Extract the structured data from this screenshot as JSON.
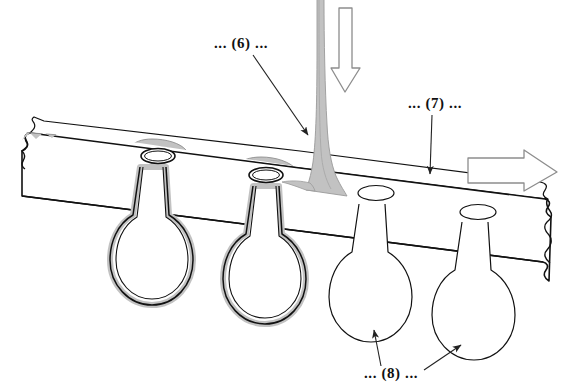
{
  "figure": {
    "type": "technical-line-diagram",
    "background_color": "#ffffff",
    "line_color": "#111111",
    "coating_fill_color": "#c2c2c2",
    "coating_edge_color": "#8a8a8a",
    "arrow_stroke_color": "#8d8d8d"
  },
  "callouts": [
    {
      "id": "callout-6",
      "label": "... (6) ...",
      "text_x": 214,
      "text_y": 48,
      "leader": {
        "x1": 253,
        "y1": 55,
        "x2": 308,
        "y2": 135
      },
      "refers_to": "vertical-coating-stream"
    },
    {
      "id": "callout-7",
      "label": "... (7) ...",
      "text_x": 408,
      "text_y": 108,
      "leader": {
        "x1": 432,
        "y1": 115,
        "x2": 430,
        "y2": 176
      },
      "refers_to": "perforated-plate"
    },
    {
      "id": "callout-8",
      "label": "... (8) ...",
      "text_x": 364,
      "text_y": 378,
      "leaders": [
        {
          "x1": 377,
          "y1": 364,
          "x2": 375,
          "y2": 330
        },
        {
          "x1": 424,
          "y1": 369,
          "x2": 462,
          "y2": 344
        }
      ],
      "refers_to": "uncoated-pendant-droplets"
    }
  ],
  "arrows": [
    {
      "id": "stream-direction-arrow",
      "label": "downward flow arrow",
      "direction": "down",
      "x": 330,
      "y_start": 10,
      "y_end": 90
    },
    {
      "id": "plate-travel-arrow",
      "label": "rightward plate travel arrow",
      "direction": "right",
      "y": 172,
      "x_start": 466,
      "x_end": 556
    }
  ],
  "plate": {
    "id": "perforated-plate",
    "description": "inclined perforated plate shown in perspective with torn left and right edges",
    "hole_count": 4,
    "holes": [
      {
        "index": 1,
        "cx": 158,
        "cy": 156,
        "rx": 17,
        "ry": 7.5,
        "covered_by_coating": true
      },
      {
        "index": 2,
        "cx": 265,
        "cy": 175,
        "rx": 17,
        "ry": 7.5,
        "covered_by_coating": true
      },
      {
        "index": 3,
        "cx": 376,
        "cy": 193,
        "rx": 18,
        "ry": 7.5,
        "covered_by_coating": false
      },
      {
        "index": 4,
        "cx": 478,
        "cy": 212,
        "rx": 18,
        "ry": 7.5,
        "covered_by_coating": false
      }
    ]
  },
  "droplets": [
    {
      "index": 1,
      "id": "droplet-coated-1",
      "cx": 152,
      "cy": 258,
      "coated": true
    },
    {
      "index": 2,
      "id": "droplet-coated-2",
      "cx": 265,
      "cy": 277,
      "coated": true
    },
    {
      "index": 3,
      "id": "droplet-plain-1",
      "cx": 371,
      "cy": 295,
      "coated": false
    },
    {
      "index": 4,
      "id": "droplet-plain-2",
      "cx": 474,
      "cy": 313,
      "coated": false
    }
  ],
  "stream": {
    "id": "vertical-coating-stream",
    "description": "vertical gray coating stream descending onto the plate and flaring at impact",
    "top_x": 319,
    "top_y": 0,
    "impact_x": 322,
    "impact_y": 186
  }
}
